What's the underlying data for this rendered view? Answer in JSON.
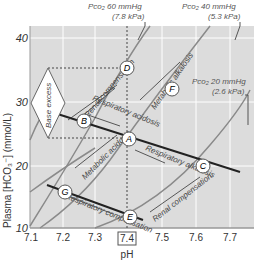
{
  "diagram": {
    "xlabel": "pH",
    "ylabel": "Plasma [HCO₃⁻] (mmol/L)",
    "x_ticks": [
      "7.1",
      "7.2",
      "7.3",
      "7.4",
      "7.5",
      "7.6",
      "7.7"
    ],
    "y_ticks": [
      "10",
      "20",
      "30",
      "40"
    ],
    "highlighted_tick": "7.4",
    "isobars": [
      {
        "line1": "Pco₂ 60 mmHg",
        "line2": "(7.8 kPa)"
      },
      {
        "line1": "Pco₂ 40 mmHg",
        "line2": "(5.3 kPa)"
      },
      {
        "line1": "Pco₂ 20 mmHg",
        "line2": "(2.6 kPa)"
      }
    ],
    "points": [
      "A",
      "B",
      "C",
      "D",
      "E",
      "F",
      "G"
    ],
    "base_excess_label": "Base excess",
    "annotations": {
      "renal_comp_top": "Renal compensation",
      "resp_acidosis": "Respiratory acidosis",
      "metab_alkalosis": "Metabolic alkalosis",
      "metab_acidosis": "Metabolic acidosis",
      "resp_alkalosis": "Respiratory alkalosis",
      "resp_comp": "Respiratory compensation",
      "renal_comp_bottom": "Renal compensation"
    },
    "colors": {
      "plot_bg": "#dcdcdc",
      "grid": "#ffffff",
      "isobar": "#8a8a8a",
      "buffer_line": "#222222"
    }
  }
}
